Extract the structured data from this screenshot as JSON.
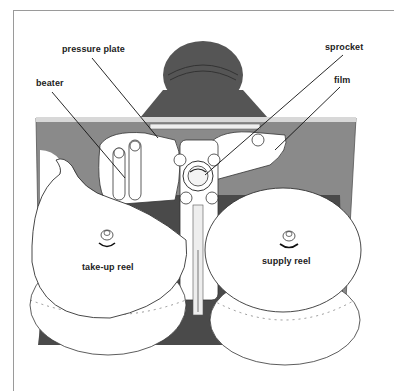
{
  "diagram": {
    "labels": {
      "pressure_plate": "pressure plate",
      "beater": "beater",
      "sprocket": "sprocket",
      "film": "film",
      "takeup_reel": "take-up reel",
      "supply_reel": "supply reel"
    },
    "colors": {
      "plate": "#8a8a8a",
      "lens": "#555555",
      "dark_base": "#4a4a4a",
      "reel": "#ffffff",
      "line": "#222222",
      "frame": "#9a9a9a"
    }
  }
}
